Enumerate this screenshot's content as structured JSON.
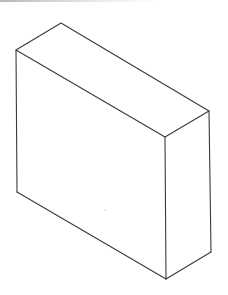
{
  "canvas": {
    "width": 228,
    "height": 295,
    "background": "#ffffff"
  },
  "diagram": {
    "type": "isometric-box",
    "stroke_color": "#3a3a3a",
    "vertices": {
      "top_back": [
        61,
        23
      ],
      "top_left": [
        16,
        50
      ],
      "top_right": [
        209,
        111
      ],
      "top_front": [
        165,
        137
      ],
      "bottom_left": [
        17,
        192
      ],
      "bottom_front": [
        166,
        279
      ],
      "bottom_right": [
        211,
        252
      ]
    }
  }
}
